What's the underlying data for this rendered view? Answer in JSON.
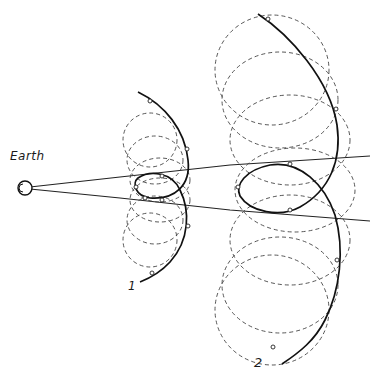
{
  "labels": {
    "earth": "Earth",
    "orbit_1": "1",
    "orbit_2": "2"
  },
  "colors": {
    "background": "#ffffff",
    "ink": "#111111",
    "dashed": "#444444"
  },
  "diagram": {
    "observer": "Earth",
    "constructions": [
      {
        "label": "1",
        "dashed_circles": 6,
        "markers": 8
      },
      {
        "label": "2",
        "dashed_circles": 6,
        "markers": 8
      }
    ],
    "sight_lines": 2
  }
}
